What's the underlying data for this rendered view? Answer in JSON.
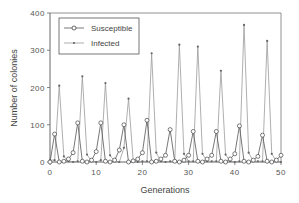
{
  "chart_data": {
    "type": "line",
    "title": "",
    "xlabel": "Generations",
    "ylabel": "Number of colonies",
    "xlim": [
      0,
      50
    ],
    "ylim": [
      0,
      400
    ],
    "xticks": [
      0,
      10,
      20,
      30,
      40,
      50
    ],
    "yticks": [
      0,
      100,
      200,
      300,
      400
    ],
    "grid": false,
    "legend_position": "upper-left-inside",
    "x": [
      0,
      1,
      2,
      3,
      4,
      5,
      6,
      7,
      8,
      9,
      10,
      11,
      12,
      13,
      14,
      15,
      16,
      17,
      18,
      19,
      20,
      21,
      22,
      23,
      24,
      25,
      26,
      27,
      28,
      29,
      30,
      31,
      32,
      33,
      34,
      35,
      36,
      37,
      38,
      39,
      40,
      41,
      42,
      43,
      44,
      45,
      46,
      47,
      48,
      49,
      50
    ],
    "series": [
      {
        "name": "Susceptible",
        "marker": "open-circle",
        "values": [
          0,
          75,
          0,
          2,
          8,
          25,
          105,
          2,
          0,
          5,
          28,
          105,
          2,
          0,
          5,
          32,
          100,
          0,
          3,
          8,
          25,
          112,
          0,
          2,
          8,
          18,
          87,
          2,
          0,
          5,
          18,
          82,
          2,
          0,
          8,
          18,
          82,
          2,
          0,
          8,
          22,
          97,
          2,
          0,
          5,
          15,
          72,
          2,
          0,
          5,
          18
        ]
      },
      {
        "name": "Infected",
        "marker": "small-dot",
        "values": [
          5,
          5,
          205,
          15,
          2,
          0,
          2,
          230,
          20,
          2,
          0,
          5,
          212,
          18,
          2,
          0,
          38,
          170,
          5,
          0,
          2,
          2,
          292,
          25,
          2,
          0,
          2,
          2,
          315,
          22,
          2,
          2,
          310,
          22,
          2,
          2,
          2,
          245,
          20,
          2,
          0,
          2,
          368,
          25,
          2,
          2,
          2,
          325,
          22,
          2,
          0
        ]
      }
    ]
  },
  "axes": {
    "xlabel": "Generations",
    "ylabel": "Number of colonies",
    "xtick_labels": [
      "0",
      "10",
      "20",
      "30",
      "40",
      "50"
    ],
    "ytick_labels": [
      "0",
      "100",
      "200",
      "300",
      "400"
    ]
  },
  "legend": {
    "items": [
      {
        "label": "Susceptible"
      },
      {
        "label": "Infected"
      }
    ]
  },
  "colors": {
    "susceptible_line": "#555555",
    "infected_line": "#9a9a9a",
    "axis": "#666666"
  }
}
